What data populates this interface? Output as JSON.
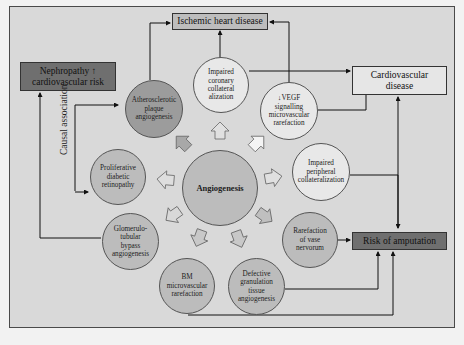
{
  "diagram": {
    "center": {
      "label": "Angiogenesis"
    },
    "outcome_boxes": {
      "ischemic": "Ischemic heart disease",
      "nephropathy": "Nephropathy ↑ cardiovascular risk",
      "cardiovascular": "Cardiovascular disease",
      "amputation": "Risk of amputation"
    },
    "side_label": "Causal association",
    "nodes": [
      {
        "id": "atherosclerotic",
        "label": "Atherosclerotic plaque angiogenesis"
      },
      {
        "id": "coronary",
        "label": "Impaired coronary collateral alization"
      },
      {
        "id": "vegf",
        "label": "↓VEGF signalling microvascular rarefaction"
      },
      {
        "id": "peripheral",
        "label": "Impaired peripheral collateralization"
      },
      {
        "id": "vase-nervorum",
        "label": "Rarefaction of vase nervorum"
      },
      {
        "id": "granulation",
        "label": "Defective granulation tissue angiogenesis"
      },
      {
        "id": "bm",
        "label": "BM microvascular rarefaction"
      },
      {
        "id": "glomerulo",
        "label": "Glomerulo- tubular bypass angiogenesis"
      },
      {
        "id": "retinopathy",
        "label": "Proliferative diabetic retinopathy"
      }
    ],
    "colors": {
      "background": "#d9d9d9",
      "dark_box": "#6f6f6f",
      "light_box": "#e6e6e6",
      "circle_light": "#e8e8e8",
      "circle_mid": "#bcbcbc",
      "circle_dark": "#9c9c9c"
    }
  }
}
